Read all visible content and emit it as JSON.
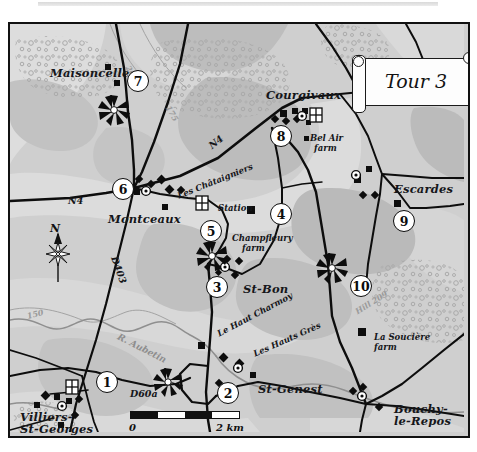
{
  "title_scroll": {
    "text": "Tour 3"
  },
  "map": {
    "settlements": [
      {
        "name": "Maisoncelles",
        "x": 40,
        "y": 44
      },
      {
        "name": "Courgivaux",
        "x": 256,
        "y": 66
      },
      {
        "name": "Montceaux",
        "x": 98,
        "y": 190
      },
      {
        "name": "Escardes",
        "x": 384,
        "y": 160
      },
      {
        "name": "St-Bon",
        "x": 233,
        "y": 260
      },
      {
        "name": "St-Genest",
        "x": 248,
        "y": 360
      },
      {
        "name": "Villiers-",
        "x": 10,
        "y": 388
      },
      {
        "name": "St-Georges",
        "x": 10,
        "y": 400
      },
      {
        "name": "Bouchy-",
        "x": 384,
        "y": 380
      },
      {
        "name": "le-Repos",
        "x": 384,
        "y": 392
      }
    ],
    "farms": [
      {
        "name": "Bel Air",
        "x": 300,
        "y": 110
      },
      {
        "name": "farm",
        "x": 304,
        "y": 120
      },
      {
        "name": "Champfleury",
        "x": 222,
        "y": 210
      },
      {
        "name": "farm",
        "x": 232,
        "y": 220
      },
      {
        "name": "La Soucière",
        "x": 364,
        "y": 309
      },
      {
        "name": "farm",
        "x": 364,
        "y": 319
      },
      {
        "name": "Station",
        "x": 208,
        "y": 180
      }
    ],
    "localities": [
      {
        "name": "Les Châtaigniers",
        "x": 168,
        "y": 168,
        "rot": -22
      },
      {
        "name": "Le Haut Charmoy",
        "x": 208,
        "y": 306,
        "rot": -28
      },
      {
        "name": "Les Hauts Grès",
        "x": 244,
        "y": 326,
        "rot": -24
      }
    ],
    "roads": [
      {
        "name": "N4",
        "x": 58,
        "y": 172,
        "rot": 0
      },
      {
        "name": "N4",
        "x": 200,
        "y": 118,
        "rot": -38
      },
      {
        "name": "D403",
        "x": 104,
        "y": 228,
        "rot": 70
      },
      {
        "name": "D60a",
        "x": 120,
        "y": 365,
        "rot": 0
      }
    ],
    "contours": [
      {
        "name": "200",
        "x": 118,
        "y": 38,
        "rot": 62
      },
      {
        "name": "175",
        "x": 158,
        "y": 78,
        "rot": 60
      },
      {
        "name": "150",
        "x": 17,
        "y": 288,
        "rot": -14
      },
      {
        "name": "Hill 209",
        "x": 346,
        "y": 284,
        "rot": -32
      }
    ],
    "rivers": [
      {
        "name": "R. Aubetin",
        "x": 108,
        "y": 308,
        "rot": 27
      }
    ],
    "tour_stops": [
      {
        "n": "1",
        "x": 86,
        "y": 347
      },
      {
        "n": "2",
        "x": 207,
        "y": 358
      },
      {
        "n": "3",
        "x": 196,
        "y": 252
      },
      {
        "n": "4",
        "x": 260,
        "y": 179
      },
      {
        "n": "5",
        "x": 190,
        "y": 196
      },
      {
        "n": "6",
        "x": 102,
        "y": 154
      },
      {
        "n": "7",
        "x": 117,
        "y": 46
      },
      {
        "n": "8",
        "x": 260,
        "y": 101
      },
      {
        "n": "9",
        "x": 383,
        "y": 186
      },
      {
        "n": "10",
        "x": 340,
        "y": 251
      }
    ],
    "compass": {
      "north_label": "N"
    },
    "scale_bar": {
      "zero": "0",
      "max": "2 km",
      "segments": 4
    },
    "colors": {
      "paper": "#cfcfcf",
      "high_ground": "#b9b9b9",
      "low_ground": "#dcdcdc",
      "road": "#0d0d0d",
      "ink": "#15161a"
    }
  }
}
